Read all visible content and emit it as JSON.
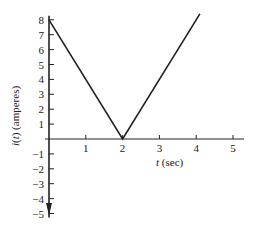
{
  "chart_data": {
    "type": "line",
    "title": "",
    "xlabel": "t (sec)",
    "ylabel": "i(t) (amperes)",
    "xlim": [
      0,
      5.3
    ],
    "ylim": [
      -5,
      8
    ],
    "x_ticks": [
      1,
      2,
      3,
      4,
      5
    ],
    "y_ticks": [
      8,
      7,
      6,
      5,
      4,
      3,
      2,
      1,
      -1,
      -2,
      -3,
      -4,
      -5
    ],
    "grid": false,
    "legend": null,
    "series": [
      {
        "name": "i(t)",
        "x": [
          0,
          2,
          4.1
        ],
        "y": [
          8,
          0,
          8.4
        ]
      }
    ],
    "annotations": [
      "Downward arrow on negative i-axis"
    ]
  },
  "style": {
    "line_color": "#222222",
    "axis_color": "#222222",
    "background": "#ffffff"
  }
}
